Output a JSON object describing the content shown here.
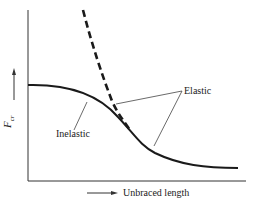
{
  "diagram": {
    "y_axis_label": "F",
    "y_axis_subscript": "cr",
    "x_axis_label": "Unbraced length",
    "curve_labels": {
      "elastic": "Elastic",
      "inelastic": "Inelastic"
    },
    "colors": {
      "ink": "#1a1a1a",
      "leader": "#444444"
    }
  }
}
